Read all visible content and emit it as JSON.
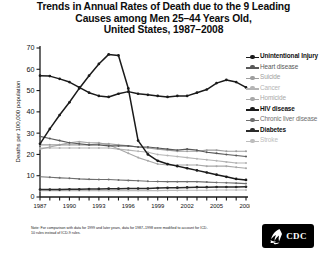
{
  "title": {
    "line1": "Trends in Annual Rates of Death due to the 9 Leading",
    "line2": "Causes among Men 25–44 Years Old,",
    "line3": "United States, 1987–2008"
  },
  "footnote": {
    "text": "Note: For comparison with data for 1999 and later years, data for 1987–1998 were modified to account for ICD-10 rules instead of ICD-9 rules."
  },
  "logo": {
    "label": "CDC",
    "icon": "hhs-eagle-icon"
  },
  "legend": {
    "position": "right",
    "items": [
      {
        "label": "Unintentional Injury",
        "color": "#1a1a1a",
        "bold": true
      },
      {
        "label": "Heart disease",
        "color": "#595959",
        "bold": false
      },
      {
        "label": "Suicide",
        "color": "#9e9e9e",
        "bold": false
      },
      {
        "label": "Cancer",
        "color": "#b5b5b5",
        "bold": false
      },
      {
        "label": "Homicide",
        "color": "#a8a8a8",
        "bold": false
      },
      {
        "label": "HIV disease",
        "color": "#1a1a1a",
        "bold": true
      },
      {
        "label": "Chronic liver disease",
        "color": "#6e6e6e",
        "bold": false
      },
      {
        "label": "Diabetes",
        "color": "#2b2b2b",
        "bold": true
      },
      {
        "label": "Stroke",
        "color": "#bdbdbd",
        "bold": false
      }
    ]
  },
  "chart_data": {
    "type": "line",
    "xlabel": "",
    "ylabel": "Deaths per 100,000 population",
    "xlim": [
      1987,
      2008
    ],
    "ylim": [
      0,
      70
    ],
    "yticks": [
      0,
      10,
      20,
      30,
      40,
      50,
      60,
      70
    ],
    "xticks": [
      1987,
      1990,
      1993,
      1996,
      1999,
      2002,
      2005,
      2008
    ],
    "xtick_labels": [
      "1987",
      "1990",
      "1993",
      "1996",
      "1999",
      "2002",
      "2005",
      "2008"
    ],
    "ytick_labels": [
      "0",
      "10",
      "20",
      "30",
      "40",
      "50",
      "60",
      "70"
    ],
    "grid": false,
    "legend_position": "right",
    "x": [
      1987,
      1988,
      1989,
      1990,
      1991,
      1992,
      1993,
      1994,
      1995,
      1996,
      1997,
      1998,
      1999,
      2000,
      2001,
      2002,
      2003,
      2004,
      2005,
      2006,
      2007,
      2008
    ],
    "series": [
      {
        "name": "Unintentional Injury",
        "color": "#1a1a1a",
        "values": [
          57.0,
          56.8,
          55.5,
          54.0,
          51.5,
          49.0,
          47.5,
          47.0,
          48.5,
          49.5,
          48.5,
          48.0,
          47.5,
          47.0,
          47.5,
          47.5,
          49.0,
          50.5,
          53.5,
          55.0,
          54.0,
          51.5
        ]
      },
      {
        "name": "Heart disease",
        "color": "#595959",
        "values": [
          28.5,
          27.5,
          26.5,
          25.5,
          25.0,
          24.5,
          24.5,
          24.0,
          24.0,
          24.0,
          23.5,
          23.5,
          23.0,
          22.5,
          22.0,
          22.5,
          22.0,
          21.0,
          20.5,
          20.0,
          19.5,
          19.0
        ]
      },
      {
        "name": "Suicide",
        "color": "#9e9e9e",
        "values": [
          24.5,
          24.5,
          24.5,
          24.5,
          24.5,
          24.5,
          25.0,
          25.0,
          24.5,
          24.0,
          23.5,
          23.0,
          22.5,
          22.0,
          21.5,
          21.5,
          21.5,
          22.0,
          22.0,
          21.5,
          21.5,
          21.5
        ]
      },
      {
        "name": "Cancer",
        "color": "#b5b5b5",
        "values": [
          23.0,
          23.0,
          23.0,
          23.0,
          23.0,
          23.0,
          23.0,
          23.0,
          22.5,
          22.0,
          21.5,
          21.0,
          20.0,
          19.5,
          19.0,
          18.5,
          18.0,
          17.5,
          17.0,
          16.5,
          16.0,
          16.0
        ]
      },
      {
        "name": "Homicide",
        "color": "#a8a8a8",
        "values": [
          22.5,
          23.5,
          24.5,
          25.5,
          26.0,
          25.5,
          25.5,
          24.5,
          22.5,
          20.5,
          18.5,
          17.0,
          15.5,
          15.0,
          15.0,
          15.0,
          15.0,
          14.5,
          14.5,
          14.5,
          14.0,
          13.5
        ]
      },
      {
        "name": "HIV disease",
        "color": "#1a1a1a",
        "values": [
          25.0,
          32.0,
          38.5,
          44.5,
          51.0,
          57.0,
          62.5,
          67.0,
          66.5,
          51.0,
          26.5,
          20.0,
          17.0,
          15.5,
          14.5,
          13.5,
          12.5,
          11.5,
          10.5,
          9.5,
          8.5,
          8.0
        ]
      },
      {
        "name": "Chronic liver disease",
        "color": "#6e6e6e",
        "values": [
          9.5,
          9.3,
          9.0,
          8.8,
          8.5,
          8.3,
          8.2,
          8.2,
          8.0,
          7.8,
          7.6,
          7.4,
          7.3,
          7.2,
          7.2,
          7.2,
          7.2,
          7.0,
          6.8,
          6.7,
          6.5,
          6.3
        ]
      },
      {
        "name": "Diabetes",
        "color": "#2b2b2b",
        "values": [
          3.5,
          3.5,
          3.5,
          3.6,
          3.6,
          3.7,
          3.8,
          3.9,
          3.9,
          4.0,
          4.0,
          4.0,
          4.2,
          4.3,
          4.4,
          4.5,
          4.6,
          4.6,
          4.7,
          4.7,
          4.7,
          4.8
        ]
      },
      {
        "name": "Stroke",
        "color": "#bdbdbd",
        "values": [
          3.0,
          3.0,
          3.0,
          3.0,
          3.0,
          3.0,
          3.0,
          3.0,
          3.0,
          3.0,
          3.0,
          3.0,
          3.0,
          3.1,
          3.1,
          3.2,
          3.2,
          3.2,
          3.3,
          3.3,
          3.3,
          3.3
        ]
      }
    ]
  }
}
